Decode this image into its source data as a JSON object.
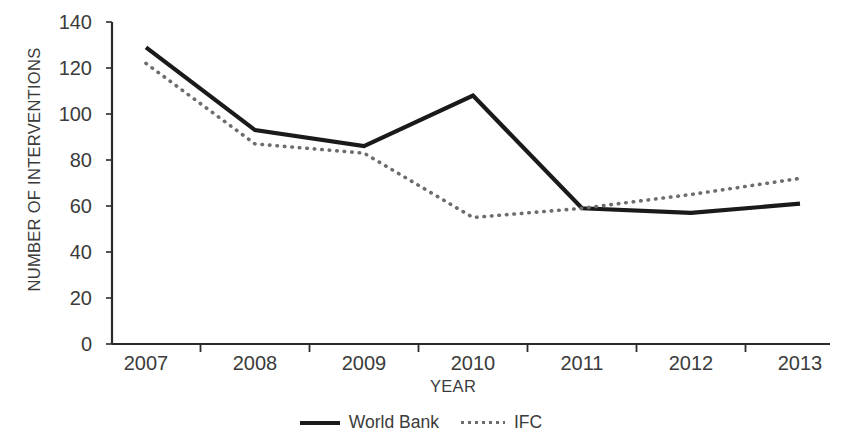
{
  "chart_data": {
    "type": "line",
    "title": "",
    "xlabel": "YEAR",
    "ylabel": "NUMBER OF INTERVENTIONS",
    "categories": [
      "2007",
      "2008",
      "2009",
      "2010",
      "2011",
      "2012",
      "2013"
    ],
    "x": [
      2007,
      2008,
      2009,
      2010,
      2011,
      2012,
      2013
    ],
    "series": [
      {
        "name": "World Bank",
        "style": "solid",
        "color": "#1a1a1a",
        "values": [
          129,
          93,
          86,
          108,
          59,
          57,
          61
        ]
      },
      {
        "name": "IFC",
        "style": "dotted",
        "color": "#6d6d6d",
        "values": [
          122,
          87,
          83,
          55,
          59,
          65,
          72
        ]
      }
    ],
    "ylim": [
      0,
      140
    ],
    "yticks": [
      0,
      20,
      40,
      60,
      80,
      100,
      120,
      140
    ],
    "ytick_labels": [
      "0",
      "20",
      "40",
      "60",
      "80",
      "100",
      "120",
      "140"
    ],
    "grid": false,
    "legend_position": "bottom-center"
  },
  "legend": {
    "entries": [
      {
        "label": "World Bank",
        "marker": "solid-line-swatch"
      },
      {
        "label": "IFC",
        "marker": "dotted-line-swatch"
      }
    ]
  },
  "axes": {
    "y_title": "NUMBER OF INTERVENTIONS",
    "x_title": "YEAR"
  }
}
